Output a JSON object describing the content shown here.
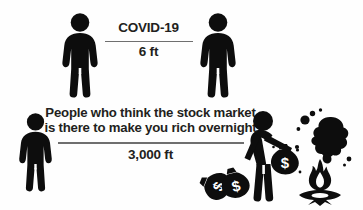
{
  "image": {
    "kind": "infographic-meme",
    "width": 363,
    "height": 210,
    "background_color": "#fefefe",
    "ink_color": "#0d0d0d",
    "rule_color": "#6f6f6f",
    "text_color": "#231f20"
  },
  "rows": [
    {
      "id": "covid-row",
      "title": "COVID-19",
      "distance": "6 ft",
      "left_figure": "standing-person-icon",
      "right_figure": "standing-person-icon"
    },
    {
      "id": "stock-market-row",
      "title_line_1": "People who think the stock market",
      "title_line_2": "is there to make you rich overnight",
      "distance": "3,000 ft",
      "left_figure": "standing-person-icon",
      "right_figure": "person-burning-money-icon",
      "props": [
        "money-bag-icon",
        "money-bag-icon",
        "money-bag-icon",
        "campfire-icon",
        "smoke-cloud-icon"
      ],
      "money_bag_symbol": "$"
    }
  ]
}
